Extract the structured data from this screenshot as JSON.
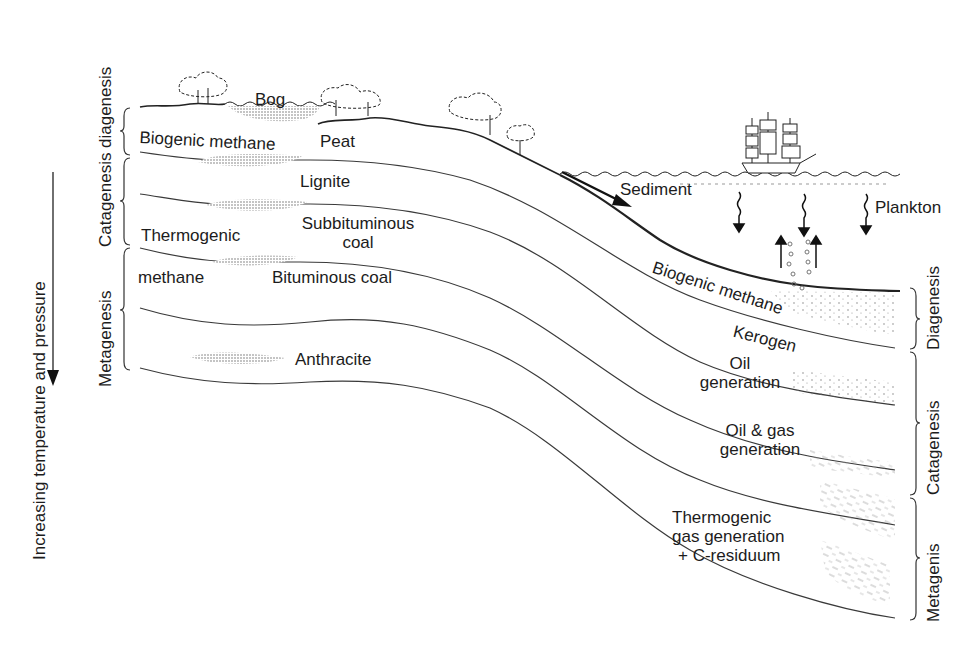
{
  "figure": {
    "axis": {
      "label": "Increasing temperature and pressure",
      "direction": "down"
    },
    "left_stages": {
      "diagenesis": "diagenesis",
      "catagenesis": "Catagenesis",
      "metagenesis": "Metagenesis"
    },
    "right_stages": {
      "diagenesis": "Diagenesis",
      "catagenesis": "Catagenesis",
      "metagenesis": "Metagenis"
    },
    "land_labels": {
      "bog": "Bog",
      "biogenic_methane": "Biogenic methane",
      "peat": "Peat",
      "lignite": "Lignite",
      "subbituminous_line1": "Subbituminous",
      "subbituminous_line2": "coal",
      "thermogenic": "Thermogenic",
      "methane": "methane",
      "bituminous": "Bituminous coal",
      "anthracite": "Anthracite"
    },
    "marine_labels": {
      "sediment": "Sediment",
      "plankton": "Plankton",
      "biogenic_methane": "Biogenic methane",
      "kerogen": "Kerogen",
      "oil_line1": "Oil",
      "oil_line2": "generation",
      "oilgas_line1": "Oil & gas",
      "oilgas_line2": "generation",
      "thermo_line1": "Thermogenic",
      "thermo_line2": "gas generation",
      "thermo_line3": "+ C-residuum"
    },
    "colors": {
      "ink": "#1c1c1c",
      "line": "#3a3a3a",
      "stipple": "#8a8a8a",
      "background": "#ffffff"
    }
  }
}
